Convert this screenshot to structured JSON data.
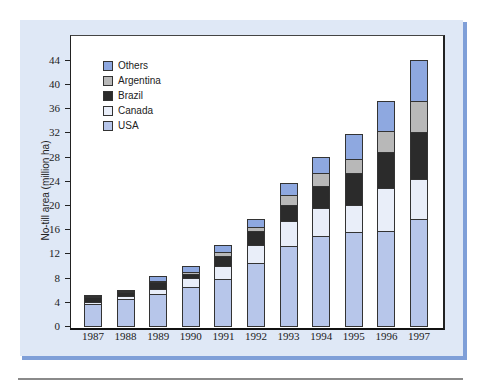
{
  "chart_data": {
    "type": "bar",
    "stacked": true,
    "title": "",
    "xlabel": "",
    "ylabel": "No-till area (million ha)",
    "ylim": [
      0,
      46
    ],
    "yticks": [
      0,
      4,
      8,
      12,
      16,
      20,
      24,
      28,
      32,
      36,
      40,
      44
    ],
    "grid": false,
    "legend_position": "upper left",
    "categories": [
      "1987",
      "1988",
      "1989",
      "1990",
      "1991",
      "1992",
      "1993",
      "1994",
      "1995",
      "1996",
      "1997"
    ],
    "series": [
      {
        "name": "USA",
        "color": "#b7c6ea",
        "values": [
          3.6,
          4.5,
          5.3,
          6.4,
          7.8,
          10.4,
          13.2,
          14.9,
          15.5,
          15.7,
          17.7
        ]
      },
      {
        "name": "Canada",
        "color": "#e9eef9",
        "values": [
          0.4,
          0.5,
          0.8,
          1.5,
          2.1,
          3.0,
          4.2,
          4.6,
          4.5,
          7.1,
          6.6
        ]
      },
      {
        "name": "Brazil",
        "color": "#2b2b2b",
        "values": [
          0.8,
          0.6,
          1.2,
          0.7,
          1.7,
          2.3,
          2.6,
          3.6,
          5.3,
          6.0,
          7.8
        ]
      },
      {
        "name": "Argentina",
        "color": "#b8b8b8",
        "values": [
          0.2,
          0.2,
          0.1,
          0.3,
          0.6,
          0.7,
          1.7,
          2.2,
          2.3,
          3.4,
          5.1
        ]
      },
      {
        "name": "Others",
        "color": "#8ea8e0",
        "values": [
          0.1,
          0.2,
          0.9,
          1.0,
          1.2,
          1.3,
          1.9,
          2.6,
          4.1,
          5.0,
          6.8
        ]
      }
    ],
    "totals": [
      5.1,
      6.0,
      8.3,
      9.9,
      13.4,
      17.7,
      23.6,
      27.9,
      31.7,
      37.2,
      44.0
    ]
  },
  "legend": [
    {
      "label": "Others",
      "color": "#8ea8e0"
    },
    {
      "label": "Argentina",
      "color": "#b8b8b8"
    },
    {
      "label": "Brazil",
      "color": "#2b2b2b"
    },
    {
      "label": "Canada",
      "color": "#e9eef9"
    },
    {
      "label": "USA",
      "color": "#b7c6ea"
    }
  ]
}
